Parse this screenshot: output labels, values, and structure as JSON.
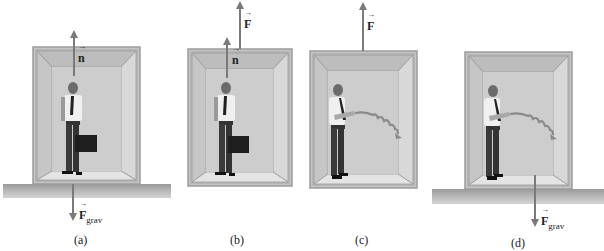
{
  "figure": {
    "panels": [
      {
        "id": "a",
        "caption": "(a)",
        "vectors": [
          {
            "name": "normal-force",
            "symbol": "n",
            "direction": "up"
          },
          {
            "name": "gravity-force",
            "symbol": "F",
            "subscript": "grav",
            "direction": "down"
          }
        ],
        "scene": "Person holding briefcase in elevator resting on floor"
      },
      {
        "id": "b",
        "caption": "(b)",
        "vectors": [
          {
            "name": "normal-force",
            "symbol": "n",
            "direction": "up"
          },
          {
            "name": "cable-force",
            "symbol": "F",
            "direction": "up"
          }
        ],
        "scene": "Person holding briefcase in elevator suspended by cable"
      },
      {
        "id": "c",
        "caption": "(c)",
        "vectors": [
          {
            "name": "cable-force",
            "symbol": "F",
            "direction": "up"
          }
        ],
        "scene": "Person releasing object in suspended elevator; object follows curved path"
      },
      {
        "id": "d",
        "caption": "(d)",
        "vectors": [
          {
            "name": "gravity-force",
            "symbol": "F",
            "subscript": "grav",
            "direction": "down"
          }
        ],
        "scene": "Person releasing object in elevator on floor; object follows curved path"
      }
    ]
  },
  "colors": {
    "elevator_outer": "#c8c8c8",
    "elevator_frame": "#b9b9b9",
    "elevator_back": "#cdcdcd",
    "elevator_floor": "#e4e4e4",
    "ground": "#a9a9a9",
    "arrow": "#7a7a7a",
    "text": "#222222"
  }
}
